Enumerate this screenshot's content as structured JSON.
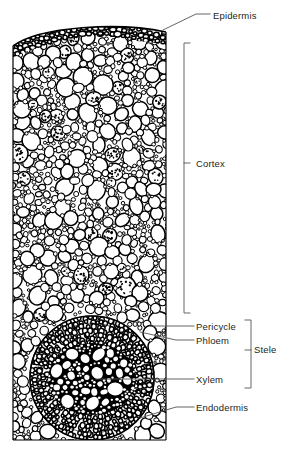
{
  "figure": {
    "type": "botanical-line-drawing",
    "background_color": "#ffffff",
    "ink_color": "#000000",
    "text_color": "#231f20"
  },
  "labels": {
    "epidermis": "Epidermis",
    "cortex": "Cortex",
    "pericycle": "Pericycle",
    "phloem": "Phloem",
    "xylem": "Xylem",
    "endodermis": "Endodermis",
    "stele": "Stele"
  },
  "structures": [
    {
      "name": "epidermis",
      "label": "Epidermis",
      "description": "Dark arched outermost band of small tightly packed cells",
      "annotation": "leader-line",
      "leader_y": 18
    },
    {
      "name": "cortex",
      "label": "Cortex",
      "description": "Broad zone of large rounded parenchyma cells, some containing dark starch granules",
      "annotation": "bracket",
      "bracket_top": 43,
      "bracket_bottom": 313
    },
    {
      "name": "pericycle",
      "label": "Pericycle",
      "description": "Outer cell layer of the stele",
      "annotation": "leader-line",
      "leader_y": 326
    },
    {
      "name": "phloem",
      "label": "Phloem",
      "description": "Small dense cells inside the pericycle",
      "annotation": "leader-line",
      "leader_y": 340
    },
    {
      "name": "xylem",
      "label": "Xylem",
      "description": "Large white vessel lumens in the dark central core",
      "annotation": "leader-line",
      "leader_y": 379
    },
    {
      "name": "endodermis",
      "label": "Endodermis",
      "description": "Boundary layer separating cortex from stele",
      "annotation": "leader-line",
      "leader_y": 407
    },
    {
      "name": "stele",
      "label": "Stele",
      "description": "Vascular cylinder grouping pericycle, phloem and xylem",
      "annotation": "bracket",
      "bracket_top": 320,
      "bracket_bottom": 388
    }
  ],
  "geometry": {
    "block_left": 13,
    "block_right": 166,
    "block_top": 22,
    "block_bottom": 440,
    "stele_center_x": 92,
    "stele_center_y": 378,
    "stele_radius": 62
  }
}
